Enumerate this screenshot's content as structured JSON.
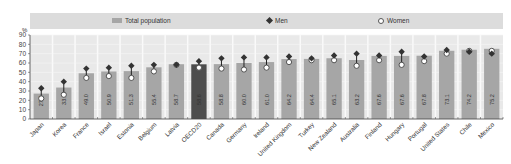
{
  "chart_data": {
    "type": "bar",
    "title": "",
    "xlabel": "",
    "ylabel": "%",
    "ylim": [
      0,
      90
    ],
    "yticks": [
      0,
      10,
      20,
      30,
      40,
      50,
      60,
      70,
      80,
      90
    ],
    "grid": true,
    "legend_position": "top",
    "legend": [
      "Total population",
      "Men",
      "Women"
    ],
    "categories": [
      "Japan",
      "Korea",
      "France",
      "Israel",
      "Estonia",
      "Belgium",
      "Latvia",
      "OECD20",
      "Canada",
      "Germany",
      "Ireland",
      "United Kingdom",
      "Turkey",
      "New Zealand",
      "Australia",
      "Finland",
      "Hungary",
      "Portugal",
      "United States",
      "Chile",
      "Mexico"
    ],
    "series": [
      {
        "name": "Total population",
        "type": "bar",
        "values": [
          27.2,
          33.7,
          49.0,
          50.9,
          51.3,
          55.4,
          58.7,
          58.6,
          58.8,
          60.0,
          61.0,
          64.2,
          64.4,
          65.1,
          63.2,
          67.6,
          67.6,
          67.8,
          73.1,
          74.2,
          75.2
        ],
        "labels": [
          "27.2",
          "33.7",
          "49.0",
          "50.9",
          "51.3",
          "55.4",
          "58.7",
          "58.6",
          "58.8",
          "60.0",
          "61.0",
          "64.2",
          "64.4",
          "65.1",
          "63.2",
          "67.6",
          "67.6",
          "67.8",
          "73.1",
          "74.2",
          "75.2"
        ]
      },
      {
        "name": "Men",
        "type": "marker-diamond",
        "values": [
          33,
          40,
          54,
          55,
          57,
          58,
          58,
          62,
          65,
          66,
          66,
          67,
          65,
          68,
          70,
          68,
          72,
          67,
          74,
          72,
          70
        ]
      },
      {
        "name": "Women",
        "type": "marker-circle",
        "values": [
          22,
          26,
          44,
          46,
          44,
          51,
          58,
          55,
          54,
          53,
          55,
          61,
          63,
          63,
          57,
          63,
          58,
          62,
          70,
          73,
          73
        ]
      }
    ],
    "highlight_category": "OECD20",
    "colors": {
      "bar": "#a6a6a6",
      "highlight_bar": "#4d4d4d",
      "men": "#333333",
      "women": "#ffffff",
      "plot_bg": "#e9e9e9",
      "legend_bg": "#dcdcdc"
    }
  },
  "legend": {
    "total": "Total population",
    "men": "Men",
    "women": "Women"
  },
  "axis": {
    "unit": "%"
  }
}
